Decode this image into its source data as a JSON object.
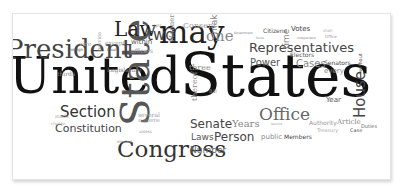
{
  "word_cloud": {
    "words": [
      {
        "text": "United",
        "size": 50,
        "x": 8,
        "y": 50,
        "color": "#111111",
        "vertical": false,
        "sans": false
      },
      {
        "text": "States",
        "size": 60,
        "x": 179,
        "y": 44,
        "color": "#111111",
        "vertical": false,
        "sans": false
      },
      {
        "text": "State",
        "size": 40,
        "x": 114,
        "y": 125,
        "color": "#555555",
        "vertical": true,
        "sans": false
      },
      {
        "text": "President",
        "size": 26,
        "x": 5,
        "y": 35,
        "color": "#444444",
        "vertical": false,
        "sans": false
      },
      {
        "text": "may",
        "size": 31,
        "x": 158,
        "y": 16,
        "color": "#222222",
        "vertical": false,
        "sans": false
      },
      {
        "text": "Congress",
        "size": 23,
        "x": 116,
        "y": 137,
        "color": "#333333",
        "vertical": false,
        "sans": false
      },
      {
        "text": "Law",
        "size": 20,
        "x": 113,
        "y": 18,
        "color": "#222222",
        "vertical": false,
        "sans": false
      },
      {
        "text": "Section",
        "size": 15,
        "x": 59,
        "y": 104,
        "color": "#333333",
        "vertical": false,
        "sans": true
      },
      {
        "text": "Constitution",
        "size": 11,
        "x": 54,
        "y": 122,
        "color": "#444444",
        "vertical": false,
        "sans": true
      },
      {
        "text": "Representatives",
        "size": 13,
        "x": 248,
        "y": 40,
        "color": "#444444",
        "vertical": false,
        "sans": true
      },
      {
        "text": "House",
        "size": 15,
        "x": 352,
        "y": 117,
        "color": "#444444",
        "vertical": true,
        "sans": true
      },
      {
        "text": "Office",
        "size": 17,
        "x": 258,
        "y": 105,
        "color": "#666666",
        "vertical": false,
        "sans": false
      },
      {
        "text": "Senate",
        "size": 12,
        "x": 189,
        "y": 117,
        "color": "#444444",
        "vertical": false,
        "sans": true
      },
      {
        "text": "Person",
        "size": 12,
        "x": 213,
        "y": 130,
        "color": "#444444",
        "vertical": false,
        "sans": true
      },
      {
        "text": "Power",
        "size": 10,
        "x": 249,
        "y": 57,
        "color": "#555555",
        "vertical": false,
        "sans": true
      },
      {
        "text": "Cases",
        "size": 10,
        "x": 295,
        "y": 58,
        "color": "#888888",
        "vertical": false,
        "sans": true
      },
      {
        "text": "two",
        "size": 15,
        "x": 146,
        "y": 27,
        "color": "#444444",
        "vertical": false,
        "sans": true
      },
      {
        "text": "one",
        "size": 15,
        "x": 205,
        "y": 28,
        "color": "#888888",
        "vertical": false,
        "sans": false
      },
      {
        "text": "Laws",
        "size": 9,
        "x": 190,
        "y": 132,
        "color": "#555555",
        "vertical": false,
        "sans": true
      },
      {
        "text": "Number",
        "size": 9,
        "x": 189,
        "y": 145,
        "color": "#666666",
        "vertical": false,
        "sans": true
      },
      {
        "text": "Years",
        "size": 10,
        "x": 231,
        "y": 118,
        "color": "#888888",
        "vertical": false,
        "sans": false
      },
      {
        "text": "Year",
        "size": 7,
        "x": 325,
        "y": 96,
        "color": "#555555",
        "vertical": false,
        "sans": true
      },
      {
        "text": "Votes",
        "size": 7,
        "x": 290,
        "y": 25,
        "color": "#444444",
        "vertical": false,
        "sans": true
      },
      {
        "text": "Electors",
        "size": 6,
        "x": 289,
        "y": 51,
        "color": "#555555",
        "vertical": false,
        "sans": true
      },
      {
        "text": "Senators",
        "size": 6,
        "x": 323,
        "y": 59,
        "color": "#444444",
        "vertical": false,
        "sans": true
      },
      {
        "text": "every",
        "size": 7,
        "x": 323,
        "y": 67,
        "color": "#888888",
        "vertical": false,
        "sans": true
      },
      {
        "text": "time",
        "size": 9,
        "x": 281,
        "y": 48,
        "color": "#888888",
        "vertical": true,
        "sans": true
      },
      {
        "text": "Citizens",
        "size": 6,
        "x": 262,
        "y": 27,
        "color": "#555555",
        "vertical": false,
        "sans": true
      },
      {
        "text": "Members",
        "size": 6,
        "x": 283,
        "y": 133,
        "color": "#444444",
        "vertical": false,
        "sans": true
      },
      {
        "text": "public",
        "size": 7,
        "x": 260,
        "y": 133,
        "color": "#888888",
        "vertical": false,
        "sans": true
      },
      {
        "text": "Authority",
        "size": 6,
        "x": 308,
        "y": 119,
        "color": "#999999",
        "vertical": false,
        "sans": true
      },
      {
        "text": "Article",
        "size": 7,
        "x": 336,
        "y": 118,
        "color": "#888888",
        "vertical": false,
        "sans": false
      },
      {
        "text": "Duties",
        "size": 5,
        "x": 360,
        "y": 123,
        "color": "#666666",
        "vertical": false,
        "sans": true
      },
      {
        "text": "Case",
        "size": 5,
        "x": 349,
        "y": 127,
        "color": "#555555",
        "vertical": false,
        "sans": true
      },
      {
        "text": "Treasury",
        "size": 5,
        "x": 316,
        "y": 127,
        "color": "#aaaaaa",
        "vertical": false,
        "sans": true
      },
      {
        "text": "without",
        "size": 5,
        "x": 357,
        "y": 71,
        "color": "#555555",
        "vertical": true,
        "sans": true
      },
      {
        "text": "Consent",
        "size": 8,
        "x": 182,
        "y": 21,
        "color": "#999999",
        "vertical": false,
        "sans": false
      },
      {
        "text": "make",
        "size": 9,
        "x": 209,
        "y": 33,
        "color": "#888888",
        "vertical": true,
        "sans": true
      },
      {
        "text": "Manner",
        "size": 7,
        "x": 168,
        "y": 41,
        "color": "#888888",
        "vertical": true,
        "sans": false
      },
      {
        "text": "three",
        "size": 8,
        "x": 188,
        "y": 63,
        "color": "#888888",
        "vertical": false,
        "sans": false
      },
      {
        "text": "thereof",
        "size": 8,
        "x": 190,
        "y": 100,
        "color": "#888888",
        "vertical": true,
        "sans": false
      },
      {
        "text": "within",
        "size": 7,
        "x": 130,
        "y": 38,
        "color": "#555555",
        "vertical": false,
        "sans": true
      },
      {
        "text": "officers",
        "size": 6,
        "x": 130,
        "y": 47,
        "color": "#999999",
        "vertical": false,
        "sans": true
      },
      {
        "text": "Legislature",
        "size": 6,
        "x": 106,
        "y": 66,
        "color": "#777777",
        "vertical": false,
        "sans": false
      },
      {
        "text": "thirds",
        "size": 6,
        "x": 56,
        "y": 70,
        "color": "#888888",
        "vertical": false,
        "sans": false
      },
      {
        "text": "except",
        "size": 6,
        "x": 104,
        "y": 39,
        "color": "#999999",
        "vertical": false,
        "sans": false
      },
      {
        "text": "vice",
        "size": 6,
        "x": 78,
        "y": 40,
        "color": "#aaaaaa",
        "vertical": false,
        "sans": false
      },
      {
        "text": "provide",
        "size": 5,
        "x": 96,
        "y": 50,
        "color": "#999999",
        "vertical": true,
        "sans": false
      },
      {
        "text": "Court",
        "size": 4,
        "x": 106,
        "y": 47,
        "color": "#555555",
        "vertical": false,
        "sans": true
      },
      {
        "text": "foreign",
        "size": 4,
        "x": 68,
        "y": 47,
        "color": "#555555",
        "vertical": false,
        "sans": true
      },
      {
        "text": "several",
        "size": 6,
        "x": 137,
        "y": 111,
        "color": "#999999",
        "vertical": false,
        "sans": false
      },
      {
        "text": "supreme",
        "size": 5,
        "x": 137,
        "y": 117,
        "color": "#999999",
        "vertical": false,
        "sans": true
      },
      {
        "text": "unless",
        "size": 4,
        "x": 138,
        "y": 129,
        "color": "#999999",
        "vertical": false,
        "sans": true
      },
      {
        "text": "made",
        "size": 5,
        "x": 54,
        "y": 113,
        "color": "#aaaaaa",
        "vertical": false,
        "sans": false
      },
      {
        "text": "chosen",
        "size": 4,
        "x": 50,
        "y": 121,
        "color": "#aaaaaa",
        "vertical": false,
        "sans": true
      },
      {
        "text": "elected",
        "size": 4,
        "x": 116,
        "y": 139,
        "color": "#999999",
        "vertical": false,
        "sans": true
      },
      {
        "text": "Bill",
        "size": 5,
        "x": 208,
        "y": 88,
        "color": "#777777",
        "vertical": false,
        "sans": true
      },
      {
        "text": "Government",
        "size": 3,
        "x": 233,
        "y": 31,
        "color": "#777777",
        "vertical": false,
        "sans": true
      },
      {
        "text": "Rules",
        "size": 3,
        "x": 255,
        "y": 36,
        "color": "#999999",
        "vertical": false,
        "sans": true
      },
      {
        "text": "Service",
        "size": 3,
        "x": 270,
        "y": 122,
        "color": "#999999",
        "vertical": false,
        "sans": true
      },
      {
        "text": "right",
        "size": 4,
        "x": 151,
        "y": 23,
        "color": "#999999",
        "vertical": false,
        "sans": true
      },
      {
        "text": "Office",
        "size": 4,
        "x": 324,
        "y": 34,
        "color": "#999999",
        "vertical": false,
        "sans": true
      },
      {
        "text": "Independent",
        "size": 3,
        "x": 296,
        "y": 36,
        "color": "#888888",
        "vertical": false,
        "sans": true
      },
      {
        "text": "shall",
        "size": 4,
        "x": 322,
        "y": 28,
        "color": "#aaaaaa",
        "vertical": false,
        "sans": true
      }
    ]
  }
}
